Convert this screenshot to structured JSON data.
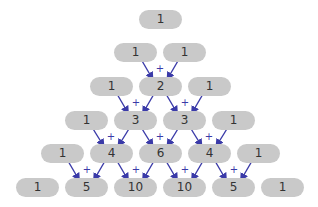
{
  "diagram": {
    "rows": [
      [
        1
      ],
      [
        1,
        1
      ],
      [
        1,
        2,
        1
      ],
      [
        1,
        3,
        3,
        1
      ],
      [
        1,
        4,
        6,
        4,
        1
      ],
      [
        1,
        5,
        10,
        10,
        5,
        1
      ]
    ],
    "operator_symbol": "+",
    "colors": {
      "pill": "#c9c9c9",
      "text": "#333333",
      "arrow": "#3a3aa8"
    }
  }
}
